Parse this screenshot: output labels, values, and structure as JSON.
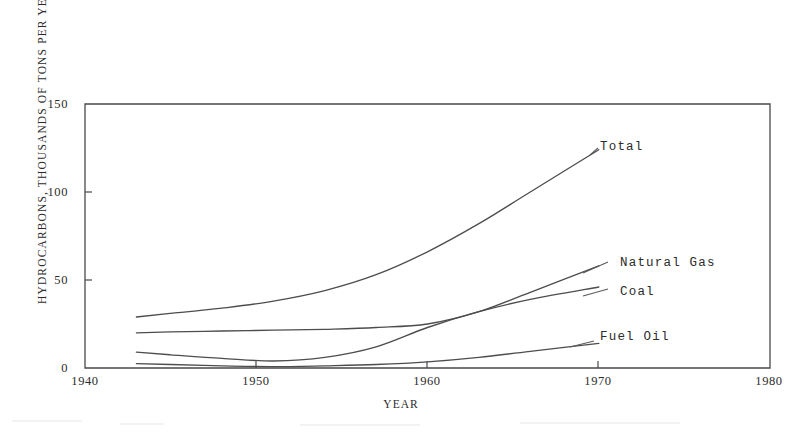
{
  "chart_data": {
    "type": "line",
    "title": "",
    "xlabel": "YEAR",
    "ylabel": "HYDROCARBONS, THOUSANDS OF TONS PER YEAR",
    "xlim": [
      1940,
      1980
    ],
    "ylim": [
      0,
      150
    ],
    "xticks": [
      "1940",
      "1950",
      "1960",
      "1970",
      "1980"
    ],
    "yticks": [
      "0",
      "50",
      "100",
      "150"
    ],
    "grid": false,
    "legend_position": "inline-right-of-curve-ends",
    "x": [
      1943,
      1945,
      1948,
      1951,
      1954,
      1957,
      1960,
      1963,
      1966,
      1970
    ],
    "series": [
      {
        "name": "Total",
        "label": "Total",
        "values": [
          29,
          31,
          34,
          38,
          44,
          53,
          66,
          82,
          100,
          124
        ]
      },
      {
        "name": "Natural Gas",
        "label": "Natural Gas",
        "values": [
          20,
          20.5,
          21,
          21.5,
          22,
          23,
          25,
          32,
          43,
          58
        ]
      },
      {
        "name": "Coal",
        "label": "Coal",
        "values": [
          9,
          7.5,
          5.5,
          4,
          6,
          12,
          23,
          32,
          39,
          46
        ]
      },
      {
        "name": "Fuel Oil",
        "label": "Fuel Oil",
        "values": [
          2.5,
          2,
          1.2,
          0.8,
          1.2,
          2,
          3.5,
          6,
          9.5,
          14
        ]
      }
    ]
  },
  "axis": {
    "y_title": "HYDROCARBONS, THOUSANDS OF TONS PER YEAR",
    "x_title": "YEAR",
    "y_ticks": [
      {
        "value": 150,
        "label": "150"
      },
      {
        "value": 100,
        "label": "100"
      },
      {
        "value": 50,
        "label": "50"
      },
      {
        "value": 0,
        "label": "0"
      }
    ],
    "x_ticks": [
      {
        "value": 1940,
        "label": "1940"
      },
      {
        "value": 1950,
        "label": "1950"
      },
      {
        "value": 1960,
        "label": "1960"
      },
      {
        "value": 1970,
        "label": "1970"
      },
      {
        "value": 1980,
        "label": "1980"
      }
    ]
  },
  "series_labels": [
    {
      "name": "total",
      "text": "Total"
    },
    {
      "name": "natural-gas",
      "text": "Natural Gas"
    },
    {
      "name": "coal",
      "text": "Coal"
    },
    {
      "name": "fuel-oil",
      "text": "Fuel Oil"
    }
  ],
  "colors": {
    "ink": "#4a4a4a",
    "text": "#2b2b2b",
    "background": "#ffffff"
  }
}
